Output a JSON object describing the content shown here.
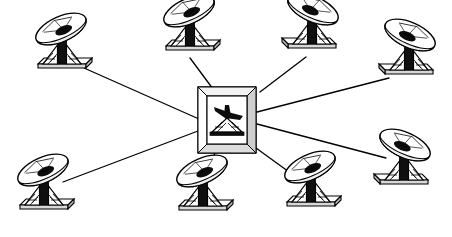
{
  "canvas": {
    "width": 452,
    "height": 237,
    "background": "#ffffff",
    "stroke": "#000000",
    "fill_light": "#ffffff",
    "fill_shade": "#d8d8d8",
    "fill_dark": "#1a1a1a"
  },
  "diagram": {
    "type": "star-topology-network",
    "node_count": 9,
    "link_count": 8,
    "icon_names": [
      "satellite-dish-icon",
      "central-hub-icon",
      "network-link-line"
    ]
  },
  "hub": {
    "label": "central-hub",
    "icon": "framed-antenna-tower-icon",
    "x": 227,
    "y": 120,
    "width": 58,
    "height": 66,
    "frame_inset": 9,
    "description": "beveled square frame enclosing a dish antenna on a lattice tower"
  },
  "nodes": [
    {
      "id": "dish-top-left",
      "label": "ground-station-1",
      "icon": "satellite-dish-icon",
      "x": 62,
      "y": 54,
      "scale": 1.0,
      "mirrored": false,
      "link_from": {
        "x": 84,
        "y": 68
      },
      "link_to": {
        "x": 199,
        "y": 119
      }
    },
    {
      "id": "dish-top-center-left",
      "label": "ground-station-2",
      "icon": "satellite-dish-icon",
      "x": 190,
      "y": 36,
      "scale": 1.0,
      "mirrored": false,
      "link_from": {
        "x": 190,
        "y": 58
      },
      "link_to": {
        "x": 213,
        "y": 89
      }
    },
    {
      "id": "dish-top-center-right",
      "label": "ground-station-3",
      "icon": "satellite-dish-icon",
      "x": 312,
      "y": 34,
      "scale": 1.0,
      "mirrored": true,
      "link_from": {
        "x": 306,
        "y": 57
      },
      "link_to": {
        "x": 260,
        "y": 92
      }
    },
    {
      "id": "dish-top-right",
      "label": "ground-station-4",
      "icon": "satellite-dish-icon",
      "x": 409,
      "y": 60,
      "scale": 1.0,
      "mirrored": true,
      "link_from": {
        "x": 389,
        "y": 78
      },
      "link_to": {
        "x": 257,
        "y": 112
      }
    },
    {
      "id": "dish-right",
      "label": "ground-station-5",
      "icon": "satellite-dish-icon",
      "x": 404,
      "y": 170,
      "scale": 1.0,
      "mirrored": true,
      "link_from": {
        "x": 386,
        "y": 158
      },
      "link_to": {
        "x": 257,
        "y": 124
      }
    },
    {
      "id": "dish-bottom-right",
      "label": "ground-station-6",
      "icon": "satellite-dish-icon",
      "x": 311,
      "y": 192,
      "scale": 1.0,
      "mirrored": false,
      "link_from": {
        "x": 296,
        "y": 177
      },
      "link_to": {
        "x": 256,
        "y": 148
      }
    },
    {
      "id": "dish-bottom-center",
      "label": "ground-station-7",
      "icon": "satellite-dish-icon",
      "x": 203,
      "y": 196,
      "scale": 1.0,
      "mirrored": false,
      "link_from": {
        "x": 208,
        "y": 178
      },
      "link_to": {
        "x": 215,
        "y": 152
      }
    },
    {
      "id": "dish-bottom-left",
      "label": "ground-station-8",
      "icon": "satellite-dish-icon",
      "x": 44,
      "y": 195,
      "scale": 1.0,
      "mirrored": false,
      "link_from": {
        "x": 63,
        "y": 182
      },
      "link_to": {
        "x": 198,
        "y": 131
      }
    }
  ]
}
